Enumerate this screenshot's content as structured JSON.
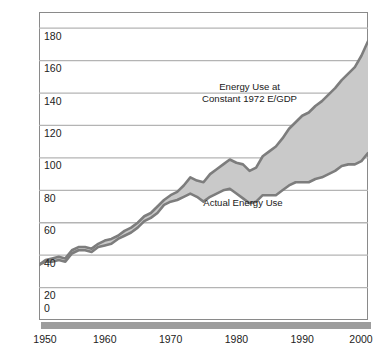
{
  "chart_data": {
    "type": "area",
    "title": "",
    "subtitle": "",
    "xlabel": "",
    "ylabel": "Primary Energy Use (quadrillion Btus)",
    "xlim": [
      1950,
      2000
    ],
    "ylim": [
      0,
      190
    ],
    "grid": true,
    "legend_position": "inline-annotations",
    "y_ticks": [
      0,
      20,
      40,
      60,
      80,
      100,
      120,
      140,
      160,
      180
    ],
    "y_tick_labels": [
      "0",
      "20",
      "40",
      "60",
      "80",
      "100",
      "120",
      "140",
      "160",
      "180"
    ],
    "x_ticks": [
      1950,
      1960,
      1970,
      1980,
      1990,
      2000
    ],
    "x_tick_labels": [
      "1950",
      "1960",
      "1970",
      "1980",
      "1990",
      "2000"
    ],
    "annotations": [
      {
        "text_line1": "Energy Use at",
        "text_line2": "Constant 1972 E/GDP",
        "x": 1982,
        "y": 140
      },
      {
        "text_line1": "Actual Energy Use",
        "text_line2": "",
        "x": 1981,
        "y": 72
      }
    ],
    "fill_color": "#c9c9c9",
    "line_color": "#7d7d7d",
    "frame_color": "#8a8a8a",
    "gridline_color": "#b4b4b4",
    "x": [
      1950,
      1951,
      1952,
      1953,
      1954,
      1955,
      1956,
      1957,
      1958,
      1959,
      1960,
      1961,
      1962,
      1963,
      1964,
      1965,
      1966,
      1967,
      1968,
      1969,
      1970,
      1971,
      1972,
      1973,
      1974,
      1975,
      1976,
      1977,
      1978,
      1979,
      1980,
      1981,
      1982,
      1983,
      1984,
      1985,
      1986,
      1987,
      1988,
      1989,
      1990,
      1991,
      1992,
      1993,
      1994,
      1995,
      1996,
      1997,
      1998,
      1999,
      2000
    ],
    "series": [
      {
        "name": "Energy Use at Constant 1972 E/GDP",
        "values": [
          34,
          37,
          38,
          39,
          38,
          43,
          45,
          45,
          44,
          47,
          49,
          50,
          52,
          55,
          57,
          60,
          64,
          66,
          70,
          74,
          77,
          79,
          83,
          88,
          86,
          85,
          90,
          93,
          96,
          99,
          97,
          96,
          92,
          94,
          101,
          104,
          107,
          112,
          118,
          122,
          126,
          128,
          132,
          135,
          139,
          143,
          148,
          152,
          156,
          163,
          172
        ]
      },
      {
        "name": "Actual Energy Use",
        "values": [
          34,
          36,
          36,
          37,
          36,
          41,
          43,
          43,
          42,
          45,
          46,
          47,
          50,
          52,
          54,
          57,
          61,
          63,
          66,
          71,
          73,
          74,
          76,
          78,
          76,
          73,
          76,
          78,
          80,
          81,
          78,
          75,
          72,
          73,
          77,
          77,
          77,
          80,
          83,
          85,
          85,
          85,
          87,
          88,
          90,
          92,
          95,
          96,
          96,
          98,
          103
        ]
      }
    ]
  },
  "axis_title": {
    "y": "Primary Energy Use (quadrillion Btus)"
  }
}
